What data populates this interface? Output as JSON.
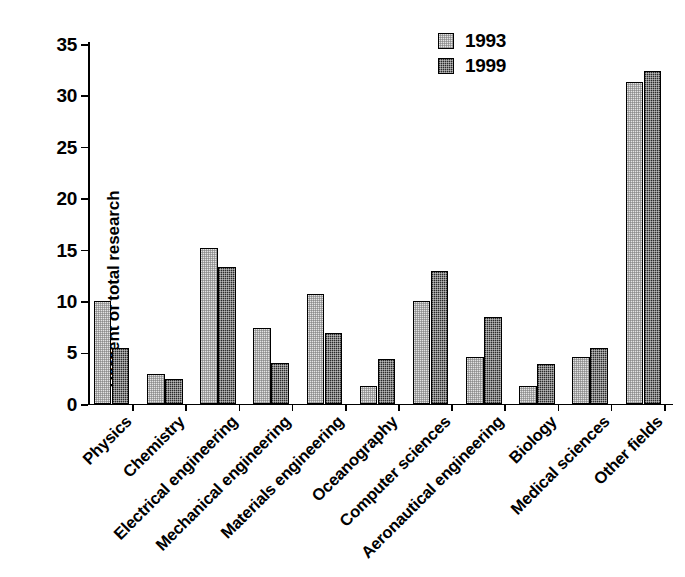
{
  "chart_data": {
    "type": "bar",
    "title": "",
    "xlabel": "",
    "ylabel": "Percent of total research",
    "ylim": [
      0,
      35
    ],
    "yticks": [
      0,
      5,
      10,
      15,
      20,
      25,
      30,
      35
    ],
    "grid": false,
    "legend_position": "top-right",
    "categories": [
      "Physics",
      "Chemistry",
      "Electrical engineering",
      "Mechanical engineering",
      "Materials engineering",
      "Oceanography",
      "Computer sciences",
      "Aeronautical engineering",
      "Biology",
      "Medical sciences",
      "Other fields"
    ],
    "series": [
      {
        "name": "1993",
        "color": "#e3e3e3",
        "values": [
          10.0,
          2.9,
          15.2,
          7.4,
          10.7,
          1.8,
          10.0,
          4.6,
          1.8,
          4.6,
          31.3
        ]
      },
      {
        "name": "1999",
        "color": "#2b2b2b",
        "values": [
          5.4,
          2.4,
          13.3,
          4.0,
          6.9,
          4.4,
          12.9,
          8.5,
          3.9,
          5.4,
          32.4
        ]
      }
    ]
  }
}
